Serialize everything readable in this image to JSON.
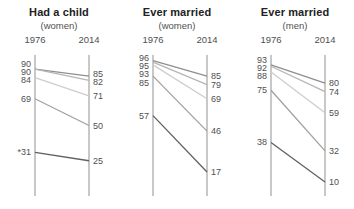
{
  "style": {
    "background": "#ffffff",
    "axis_color": "#9b9b9b",
    "label_color": "#4f4f4f",
    "title_color": "#222222",
    "line_colors": [
      "#8f8f8f",
      "#b5b5b5",
      "#cdcdcd",
      "#a1a1a1",
      "#606060"
    ]
  },
  "chart_data": [
    {
      "type": "line",
      "subtype": "slope",
      "title": "Had a child",
      "subtitle": "(women)",
      "x_labels": [
        "1976",
        "2014"
      ],
      "ylim": [
        0,
        100
      ],
      "series": [
        {
          "values": [
            90,
            85
          ],
          "from_label": "90",
          "to_label": "85"
        },
        {
          "values": [
            90,
            82
          ],
          "from_label": "90",
          "to_label": "82"
        },
        {
          "values": [
            84,
            71
          ],
          "from_label": "84",
          "to_label": "71"
        },
        {
          "values": [
            69,
            50
          ],
          "from_label": "69",
          "to_label": "50"
        },
        {
          "values": [
            31,
            25
          ],
          "from_label": "*31",
          "to_label": "25"
        }
      ]
    },
    {
      "type": "line",
      "subtype": "slope",
      "title": "Ever married",
      "subtitle": "(women)",
      "x_labels": [
        "1976",
        "2014"
      ],
      "ylim": [
        0,
        100
      ],
      "series": [
        {
          "values": [
            96,
            85
          ],
          "from_label": "96",
          "to_label": "85"
        },
        {
          "values": [
            95,
            79
          ],
          "from_label": "95",
          "to_label": "79"
        },
        {
          "values": [
            93,
            69
          ],
          "from_label": "93",
          "to_label": "69"
        },
        {
          "values": [
            85,
            46
          ],
          "from_label": "85",
          "to_label": "46"
        },
        {
          "values": [
            57,
            17
          ],
          "from_label": "57",
          "to_label": "17"
        }
      ]
    },
    {
      "type": "line",
      "subtype": "slope",
      "title": "Ever married",
      "subtitle": "(men)",
      "x_labels": [
        "1976",
        "2014"
      ],
      "ylim": [
        0,
        100
      ],
      "series": [
        {
          "values": [
            93,
            80
          ],
          "from_label": "93",
          "to_label": "80"
        },
        {
          "values": [
            92,
            74
          ],
          "from_label": "92",
          "to_label": "74"
        },
        {
          "values": [
            88,
            59
          ],
          "from_label": "88",
          "to_label": "59"
        },
        {
          "values": [
            75,
            32
          ],
          "from_label": "75",
          "to_label": "32"
        },
        {
          "values": [
            38,
            10
          ],
          "from_label": "38",
          "to_label": "10"
        }
      ]
    }
  ]
}
